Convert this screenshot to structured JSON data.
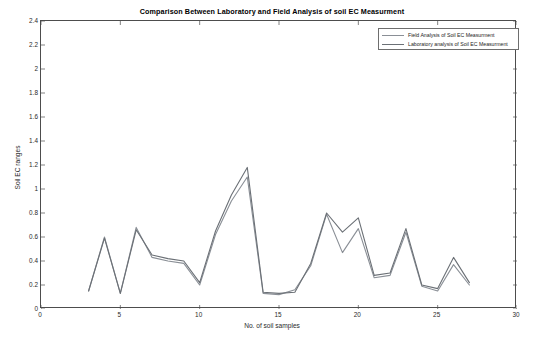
{
  "title": "Comparison Between Laboratory and Field Analysis of soil EC Measurment",
  "axes": {
    "xlabel": "No. of soil samples",
    "ylabel": "Soil EC ranges",
    "xticks": [
      "0",
      "5",
      "10",
      "15",
      "20",
      "25",
      "30"
    ],
    "yticks": [
      "0",
      "0.2",
      "0.4",
      "0.6",
      "0.8",
      "1",
      "1.2",
      "1.4",
      "1.6",
      "1.8",
      "2",
      "2.2",
      "2.4"
    ]
  },
  "legend": {
    "items": [
      {
        "label": "Field Analysis of Soil EC Measurment",
        "color": "#8a8f96"
      },
      {
        "label": "Laboratory analysis of Soil EC Measurment",
        "color": "#6b7076"
      }
    ]
  },
  "chart_data": {
    "type": "line",
    "title": "Comparison Between Laboratory and Field Analysis of soil EC Measurment",
    "xlabel": "No. of soil samples",
    "ylabel": "Soil EC ranges",
    "xlim": [
      0,
      30
    ],
    "ylim": [
      0,
      2.4
    ],
    "xtick_step": 5,
    "ytick_step": 0.2,
    "grid": false,
    "legend_position": "top-right",
    "x": [
      3,
      4,
      5,
      6,
      7,
      8,
      9,
      10,
      11,
      12,
      13,
      14,
      15,
      16,
      17,
      18,
      19,
      20,
      21,
      22,
      23,
      24,
      25,
      26,
      27
    ],
    "series": [
      {
        "name": "Field Analysis of Soil EC Measurment",
        "color": "#8a8f96",
        "values": [
          0.15,
          0.6,
          0.13,
          0.68,
          0.43,
          0.4,
          0.38,
          0.2,
          0.62,
          0.9,
          1.1,
          0.13,
          0.12,
          0.16,
          0.36,
          0.79,
          0.47,
          0.67,
          0.26,
          0.28,
          0.64,
          0.19,
          0.15,
          0.37,
          0.2
        ]
      },
      {
        "name": "Laboratory analysis of Soil EC Measurment",
        "color": "#6b7076",
        "values": [
          0.15,
          0.59,
          0.13,
          0.66,
          0.45,
          0.42,
          0.4,
          0.22,
          0.65,
          0.95,
          1.18,
          0.14,
          0.13,
          0.14,
          0.38,
          0.8,
          0.64,
          0.76,
          0.28,
          0.3,
          0.67,
          0.2,
          0.17,
          0.43,
          0.22
        ]
      }
    ]
  }
}
